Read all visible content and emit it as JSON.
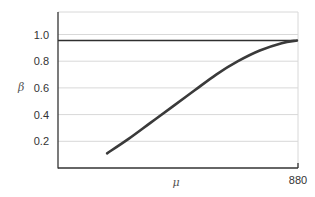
{
  "chart_data": {
    "type": "line",
    "title": "",
    "xlabel": "μ",
    "ylabel": "β",
    "xlim": [
      0,
      880
    ],
    "ylim": [
      0,
      1.17
    ],
    "x_tick_labels": [
      "880"
    ],
    "y_tick_labels": [
      "0.2",
      "0.4",
      "0.6",
      "0.8",
      "1.0"
    ],
    "y_ticks": [
      0.2,
      0.4,
      0.6,
      0.8,
      1.0
    ],
    "grid": true,
    "legend": null,
    "reference_line": {
      "orientation": "horizontal",
      "y": 0.955
    },
    "series": [
      {
        "name": "β(μ)",
        "x": [
          180,
          260,
          340,
          420,
          500,
          580,
          660,
          740,
          820,
          876
        ],
        "values": [
          0.11,
          0.22,
          0.34,
          0.46,
          0.58,
          0.7,
          0.8,
          0.88,
          0.935,
          0.955
        ]
      }
    ]
  },
  "axes": {
    "x_title": "μ",
    "y_title": "β",
    "x_end_label": "880"
  },
  "colors": {
    "curve": "#3a3a3a",
    "axis": "#333333",
    "grid": "#d8d8d8",
    "reference": "#2f2f2f"
  }
}
